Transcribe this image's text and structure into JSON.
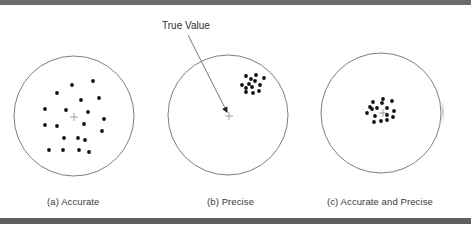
{
  "figure": {
    "annotation": {
      "text": "True Value",
      "arrow": {
        "from": [
          188,
          35
        ],
        "to": [
          227,
          112
        ]
      }
    },
    "colors": {
      "frame_bar": "#6a6a6a",
      "circle_stroke": "#707070",
      "dot": "#111111",
      "cross": "#8a8a8a",
      "text": "#3a3a3a"
    },
    "panels": [
      {
        "id": "a",
        "caption": "(a)  Accurate",
        "circle": {
          "cx": 74,
          "cy": 116,
          "r": 60
        },
        "true_value": [
          74,
          117
        ],
        "dots": [
          [
            93,
            81
          ],
          [
            72,
            85
          ],
          [
            57,
            93
          ],
          [
            99,
            98
          ],
          [
            81,
            100
          ],
          [
            45,
            109
          ],
          [
            66,
            110
          ],
          [
            88,
            112
          ],
          [
            104,
            119
          ],
          [
            84,
            124
          ],
          [
            45,
            125
          ],
          [
            57,
            126
          ],
          [
            102,
            131
          ],
          [
            64,
            138
          ],
          [
            78,
            138
          ],
          [
            85,
            140
          ],
          [
            49,
            150
          ],
          [
            63,
            150
          ],
          [
            79,
            150
          ],
          [
            89,
            152
          ]
        ]
      },
      {
        "id": "b",
        "caption": "(b)  Precise",
        "circle": {
          "cx": 228,
          "cy": 115,
          "r": 60
        },
        "true_value": [
          229,
          116
        ],
        "dots": [
          [
            246,
            76
          ],
          [
            256,
            75
          ],
          [
            251,
            79
          ],
          [
            264,
            78
          ],
          [
            255,
            81
          ],
          [
            242,
            85
          ],
          [
            249,
            84
          ],
          [
            260,
            85
          ],
          [
            246,
            88
          ],
          [
            252,
            87
          ],
          [
            246,
            92
          ],
          [
            253,
            93
          ],
          [
            259,
            91
          ]
        ]
      },
      {
        "id": "c",
        "caption": "(c)  Accurate and Precise",
        "circle": {
          "cx": 381,
          "cy": 113,
          "r": 60
        },
        "true_value": [
          383,
          113
        ],
        "dots": [
          [
            373,
            102
          ],
          [
            383,
            99
          ],
          [
            392,
            101
          ],
          [
            370,
            107
          ],
          [
            377,
            108
          ],
          [
            382,
            103
          ],
          [
            372,
            109
          ],
          [
            387,
            108
          ],
          [
            394,
            111
          ],
          [
            367,
            113
          ],
          [
            375,
            116
          ],
          [
            387,
            115
          ],
          [
            381,
            121
          ],
          [
            387,
            120
          ],
          [
            393,
            117
          ],
          [
            374,
            122
          ]
        ]
      }
    ]
  }
}
